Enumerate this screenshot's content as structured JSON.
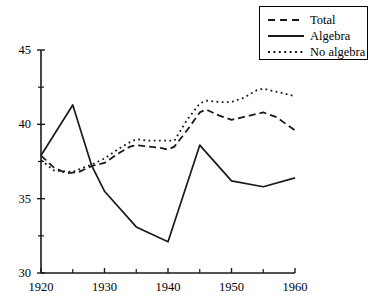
{
  "chart_data": {
    "type": "line",
    "title": "",
    "subtitle": "",
    "xlabel": "",
    "ylabel": "",
    "xlim": [
      1920,
      1960
    ],
    "ylim": [
      30,
      45
    ],
    "grid": false,
    "legend_position": "top-right",
    "x_ticks_major": [
      1920,
      1930,
      1940,
      1950,
      1960
    ],
    "x_ticks_minor": [
      1925,
      1935,
      1945,
      1955
    ],
    "y_ticks_major": [
      30,
      35,
      40,
      45
    ],
    "y_ticks_minor": [
      32.5,
      37.5,
      42.5
    ],
    "x_tick_labels": [
      "1920",
      "1930",
      "1940",
      "1950",
      "1960"
    ],
    "y_tick_labels": [
      "30",
      "35",
      "40",
      "45"
    ],
    "series": [
      {
        "name": "Total",
        "style": "dashed",
        "color": "#1a1a1a",
        "x": [
          1920,
          1922,
          1924,
          1926,
          1928,
          1930,
          1932,
          1934,
          1935,
          1937,
          1939,
          1940,
          1941,
          1943,
          1945,
          1946,
          1948,
          1950,
          1952,
          1954,
          1955,
          1957,
          1960
        ],
        "values": [
          37.9,
          37.1,
          36.7,
          36.8,
          37.2,
          37.4,
          38.0,
          38.5,
          38.6,
          38.5,
          38.4,
          38.3,
          38.5,
          39.6,
          40.8,
          41.0,
          40.6,
          40.3,
          40.5,
          40.7,
          40.8,
          40.5,
          39.6
        ]
      },
      {
        "name": "Algebra",
        "style": "solid",
        "color": "#1a1a1a",
        "x": [
          1920,
          1925,
          1928,
          1930,
          1935,
          1940,
          1945,
          1950,
          1955,
          1960
        ],
        "values": [
          37.9,
          41.3,
          37.2,
          35.5,
          33.1,
          32.1,
          38.6,
          36.2,
          35.8,
          36.4
        ]
      },
      {
        "name": "No algebra",
        "style": "dotted",
        "color": "#1a1a1a",
        "x": [
          1920,
          1922,
          1925,
          1928,
          1930,
          1932,
          1934,
          1935,
          1937,
          1939,
          1941,
          1943,
          1945,
          1946,
          1948,
          1950,
          1952,
          1954,
          1955,
          1957,
          1960
        ],
        "values": [
          37.6,
          36.9,
          36.8,
          37.3,
          37.7,
          38.3,
          38.8,
          39.0,
          38.9,
          38.9,
          38.9,
          40.3,
          41.4,
          41.6,
          41.5,
          41.5,
          41.8,
          42.3,
          42.4,
          42.2,
          41.9
        ]
      }
    ],
    "legend": [
      {
        "label": "Total",
        "style": "dashed"
      },
      {
        "label": "Algebra",
        "style": "solid"
      },
      {
        "label": "No algebra",
        "style": "dotted"
      }
    ]
  },
  "axis": {
    "x_origin_px": 41,
    "x_end_px": 295,
    "y_top_px": 50,
    "y_bottom_px": 273,
    "axis_color": "#1a1a1a"
  }
}
